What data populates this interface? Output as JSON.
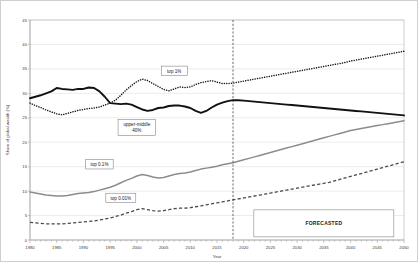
{
  "chart_data": {
    "type": "line",
    "title": "",
    "xlabel": "Year",
    "ylabel": "Share of global wealth (%)",
    "xlim": [
      1980,
      2050
    ],
    "ylim": [
      0,
      45
    ],
    "ytick_step": 5,
    "yticks": [
      "0",
      "5",
      "10",
      "15",
      "20",
      "25",
      "30",
      "35",
      "40",
      "45"
    ],
    "xticks": [
      "1980",
      "1985",
      "1990",
      "1995",
      "2000",
      "2005",
      "2010",
      "2015",
      "2020",
      "2025",
      "2030",
      "2035",
      "2040",
      "2045",
      "2050"
    ],
    "grid": true,
    "legend_position": "inline-annotations",
    "forecast_start_year": 2018,
    "annotations": [
      {
        "id": "top1",
        "label": "top 1%",
        "x": 2007,
        "y": 34.6
      },
      {
        "id": "upper-middle",
        "label": "upper-middle",
        "label2": "40%",
        "x": 2000,
        "y": 23.0
      },
      {
        "id": "top01",
        "label": "top 0.1%",
        "x": 1993,
        "y": 15.5
      },
      {
        "id": "top001",
        "label": "top 0.01%",
        "x": 1997,
        "y": 8.6
      },
      {
        "id": "forecast",
        "label": "FORECASTED",
        "x": 2035,
        "y": 3.4
      }
    ],
    "x": [
      1980,
      1981,
      1982,
      1983,
      1984,
      1985,
      1986,
      1987,
      1988,
      1989,
      1990,
      1991,
      1992,
      1993,
      1994,
      1995,
      1996,
      1997,
      1998,
      1999,
      2000,
      2001,
      2002,
      2003,
      2004,
      2005,
      2006,
      2007,
      2008,
      2009,
      2010,
      2011,
      2012,
      2013,
      2014,
      2015,
      2016,
      2017,
      2018,
      2019,
      2020,
      2021,
      2022,
      2023,
      2024,
      2025,
      2026,
      2027,
      2028,
      2029,
      2030,
      2031,
      2032,
      2033,
      2034,
      2035,
      2036,
      2037,
      2038,
      2039,
      2040,
      2041,
      2042,
      2043,
      2044,
      2045,
      2046,
      2047,
      2048,
      2049,
      2050
    ],
    "series": [
      {
        "name": "top 1%",
        "style": "dotted",
        "color": "#1a1a1a",
        "values": [
          28.0,
          27.5,
          27.1,
          26.6,
          26.2,
          25.8,
          25.6,
          25.9,
          26.2,
          26.5,
          26.7,
          26.9,
          27.0,
          27.2,
          27.6,
          28.0,
          28.6,
          29.6,
          30.7,
          31.6,
          32.4,
          32.9,
          32.6,
          32.0,
          31.4,
          30.8,
          30.5,
          30.9,
          31.3,
          31.2,
          31.3,
          31.8,
          32.2,
          32.4,
          32.6,
          32.3,
          32.0,
          32.0,
          32.1,
          32.3,
          32.5,
          32.7,
          32.9,
          33.1,
          33.3,
          33.5,
          33.7,
          33.9,
          34.1,
          34.3,
          34.5,
          34.7,
          34.9,
          35.1,
          35.3,
          35.5,
          35.7,
          35.9,
          36.1,
          36.3,
          36.6,
          36.8,
          37.0,
          37.2,
          37.4,
          37.6,
          37.8,
          38.0,
          38.2,
          38.4,
          38.6
        ]
      },
      {
        "name": "upper-middle 40%",
        "style": "solid-thick",
        "color": "#111111",
        "values": [
          29.0,
          29.3,
          29.6,
          30.0,
          30.4,
          31.1,
          30.9,
          30.8,
          30.7,
          30.9,
          30.9,
          31.2,
          31.1,
          30.4,
          29.3,
          28.0,
          27.9,
          27.8,
          27.9,
          27.7,
          27.2,
          26.7,
          26.4,
          26.6,
          27.0,
          27.1,
          27.4,
          27.5,
          27.5,
          27.3,
          27.0,
          26.4,
          26.0,
          26.4,
          27.1,
          27.7,
          28.1,
          28.4,
          28.6,
          28.6,
          28.5,
          28.4,
          28.3,
          28.2,
          28.1,
          28.0,
          27.9,
          27.8,
          27.7,
          27.6,
          27.5,
          27.4,
          27.3,
          27.2,
          27.1,
          27.0,
          26.9,
          26.8,
          26.7,
          26.6,
          26.5,
          26.4,
          26.3,
          26.2,
          26.1,
          26.0,
          25.9,
          25.8,
          25.7,
          25.6,
          25.5
        ]
      },
      {
        "name": "top 0.1%",
        "style": "solid-gray",
        "color": "#8c8c8c",
        "values": [
          9.8,
          9.6,
          9.4,
          9.2,
          9.1,
          9.0,
          9.0,
          9.1,
          9.3,
          9.5,
          9.6,
          9.7,
          9.9,
          10.2,
          10.5,
          10.8,
          11.2,
          11.7,
          12.2,
          12.6,
          13.1,
          13.4,
          13.2,
          12.9,
          12.7,
          12.8,
          13.1,
          13.4,
          13.6,
          13.7,
          13.9,
          14.2,
          14.5,
          14.7,
          14.9,
          15.1,
          15.4,
          15.6,
          15.8,
          16.1,
          16.4,
          16.7,
          17.0,
          17.3,
          17.6,
          17.9,
          18.2,
          18.5,
          18.8,
          19.1,
          19.4,
          19.7,
          20.0,
          20.3,
          20.6,
          20.9,
          21.2,
          21.5,
          21.8,
          22.1,
          22.4,
          22.6,
          22.8,
          23.0,
          23.2,
          23.4,
          23.6,
          23.8,
          24.0,
          24.2,
          24.4
        ]
      },
      {
        "name": "top 0.01%",
        "style": "dashed",
        "color": "#4a4a4a",
        "values": [
          3.6,
          3.5,
          3.4,
          3.3,
          3.3,
          3.3,
          3.3,
          3.4,
          3.5,
          3.6,
          3.7,
          3.8,
          3.9,
          4.1,
          4.3,
          4.5,
          4.8,
          5.1,
          5.5,
          5.8,
          6.2,
          6.4,
          6.2,
          6.0,
          5.9,
          6.0,
          6.2,
          6.4,
          6.5,
          6.5,
          6.6,
          6.8,
          7.0,
          7.2,
          7.4,
          7.6,
          7.8,
          8.0,
          8.2,
          8.4,
          8.6,
          8.8,
          9.0,
          9.2,
          9.4,
          9.6,
          9.8,
          10.0,
          10.2,
          10.4,
          10.6,
          10.8,
          11.0,
          11.2,
          11.4,
          11.6,
          11.8,
          12.1,
          12.4,
          12.7,
          13.0,
          13.3,
          13.6,
          13.9,
          14.2,
          14.5,
          14.8,
          15.1,
          15.4,
          15.7,
          16.0
        ]
      }
    ]
  }
}
